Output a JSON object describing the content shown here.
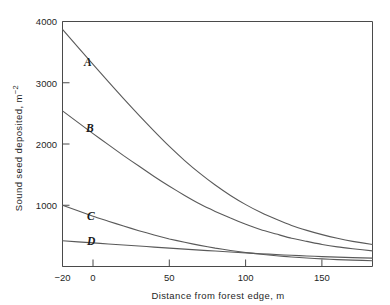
{
  "chart_data": {
    "type": "line",
    "title": "",
    "xlabel": "Distance from forest edge, m",
    "ylabel": "Sound seed deposited, m⁻²",
    "xlim": [
      -20,
      183
    ],
    "ylim": [
      0,
      4000
    ],
    "grid": false,
    "legend_position": "inline-curve-labels",
    "xticks": [
      -20,
      0,
      50,
      100,
      150
    ],
    "xtick_labels": [
      "−20",
      "0",
      "50",
      "100",
      "150"
    ],
    "yticks": [
      0,
      1000,
      2000,
      3000,
      4000
    ],
    "ytick_labels": [
      "",
      "1000",
      "2000",
      "3000",
      "4000"
    ],
    "series": [
      {
        "name": "A",
        "label": "A",
        "x": [
          -20,
          0,
          10,
          20,
          30,
          40,
          50,
          60,
          70,
          80,
          90,
          100,
          110,
          120,
          130,
          140,
          150,
          160,
          170,
          183
        ],
        "values": [
          3870,
          3300,
          3020,
          2740,
          2470,
          2210,
          1960,
          1730,
          1520,
          1330,
          1160,
          1010,
          880,
          770,
          670,
          590,
          520,
          460,
          410,
          360
        ]
      },
      {
        "name": "B",
        "label": "B",
        "x": [
          -20,
          0,
          10,
          20,
          30,
          40,
          50,
          60,
          70,
          80,
          90,
          100,
          110,
          120,
          130,
          140,
          150,
          160,
          170,
          183
        ],
        "values": [
          2540,
          2170,
          1990,
          1810,
          1640,
          1470,
          1310,
          1160,
          1020,
          900,
          790,
          690,
          600,
          530,
          460,
          410,
          360,
          320,
          290,
          255
        ]
      },
      {
        "name": "C",
        "label": "C",
        "x": [
          -20,
          0,
          10,
          20,
          30,
          40,
          50,
          60,
          70,
          80,
          90,
          100,
          110,
          120,
          130,
          140,
          150,
          160,
          170,
          183
        ],
        "values": [
          1000,
          820,
          740,
          660,
          585,
          515,
          450,
          395,
          345,
          300,
          262,
          228,
          200,
          176,
          155,
          138,
          124,
          113,
          104,
          95
        ]
      },
      {
        "name": "D",
        "label": "D",
        "x": [
          -20,
          0,
          10,
          20,
          30,
          40,
          50,
          60,
          70,
          80,
          90,
          100,
          110,
          120,
          130,
          140,
          150,
          160,
          170,
          183
        ],
        "values": [
          420,
          385,
          368,
          351,
          334,
          317,
          300,
          284,
          268,
          252,
          237,
          222,
          208,
          195,
          183,
          172,
          162,
          153,
          145,
          136
        ]
      }
    ],
    "curve_label_positions": [
      {
        "name": "A",
        "x": 5,
        "y": 3290
      },
      {
        "name": "B",
        "x": 5,
        "y": 2080
      },
      {
        "name": "C",
        "x": 5,
        "y": 880
      },
      {
        "name": "D",
        "x": 5,
        "y": 460
      }
    ],
    "annotations": []
  },
  "axes": {
    "x_label": "Distance from forest edge, m",
    "y_label": "Sound seed deposited, m⁻²",
    "y_label_main": "Sound seed deposited, m",
    "y_label_exponent": "−2",
    "x_tick_labels": [
      "−20",
      "0",
      "50",
      "100",
      "150"
    ],
    "y_tick_labels": [
      "1000",
      "2000",
      "3000",
      "4000"
    ]
  },
  "curve_labels": {
    "a": "A",
    "b": "B",
    "c": "C",
    "d": "D"
  },
  "colors": {
    "background": "#ffffff",
    "axis": "#4a4a4a",
    "curve": "#5a5a5a",
    "text": "#1f1f1f"
  }
}
